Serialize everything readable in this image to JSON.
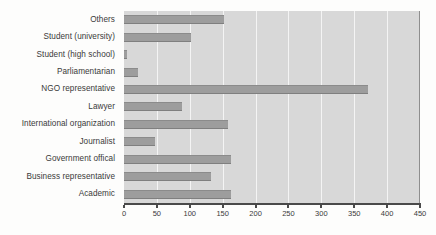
{
  "chart_data": {
    "type": "bar",
    "orientation": "horizontal",
    "title": "",
    "subtitle": "",
    "xlabel": "",
    "ylabel": "",
    "xlim": [
      0,
      450
    ],
    "xticks": [
      0,
      50,
      100,
      150,
      200,
      250,
      300,
      350,
      400,
      450
    ],
    "xtick_labels": [
      "0",
      "50",
      "100",
      "150",
      "200",
      "250",
      "300",
      "350",
      "400",
      "450"
    ],
    "grid": true,
    "grid_axis": "x",
    "legend": false,
    "legend_position": "none",
    "categories": [
      "Others",
      "Student (university)",
      "Student (high school)",
      "Parliamentarian",
      "NGO representative",
      "Lawyer",
      "International organization",
      "Journalist",
      "Government offical",
      "Business representative",
      "Academic"
    ],
    "values": [
      152,
      102,
      5,
      22,
      371,
      88,
      158,
      47,
      162,
      132,
      162
    ],
    "colors": {
      "bar": "#9d9d9d",
      "plot_background": "#d8d8d8",
      "gridline": "#f4f4f4",
      "axis": "#4a4a4a",
      "text": "#3a3a3a",
      "figure_background": "#fdfdfc"
    }
  }
}
